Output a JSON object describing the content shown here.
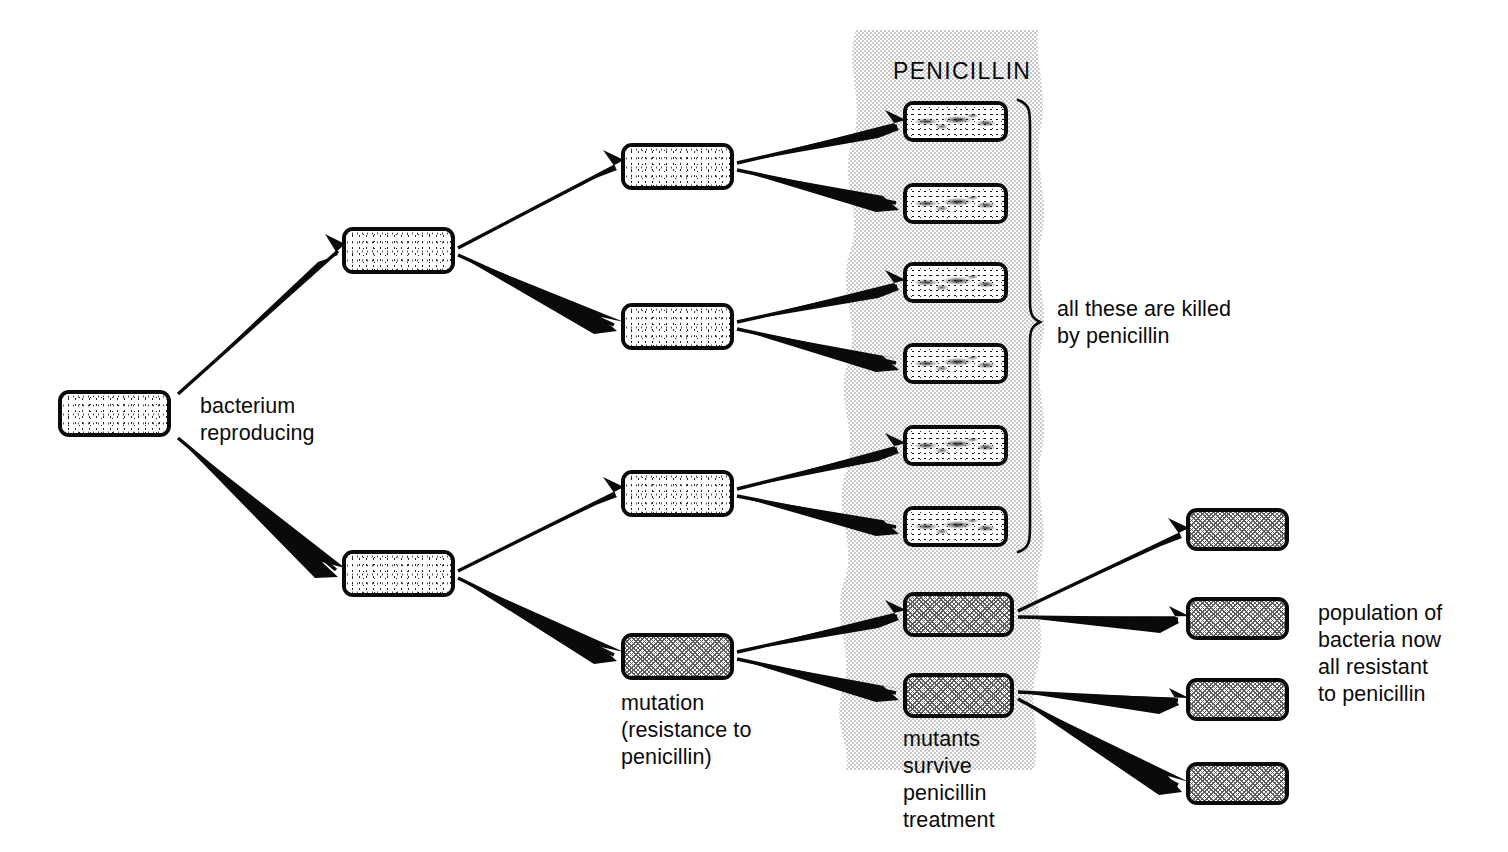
{
  "diagram": {
    "type": "flow-diagram",
    "colors": {
      "ink": "#0a0a0a",
      "paper": "#ffffff",
      "penicillin_band": "#e8e8e8",
      "mutant_fill": "#d9d9d9"
    }
  },
  "labels": {
    "penicillin": "PENICILLIN",
    "bacterium_reproducing": "bacterium\nreproducing",
    "mutation": "mutation\n(resistance to\npenicillin)",
    "mutants_survive": "mutants\nsurvive\npenicillin\ntreatment",
    "all_killed": "all these are killed\nby penicillin",
    "population_resistant": "population of\nbacteria now\nall resistant\nto penicillin"
  },
  "generations": [
    {
      "id": "gen0",
      "name": "founder bacterium",
      "count": 1,
      "cells": [
        {
          "id": "g0c1",
          "kind": "normal",
          "x": 58,
          "y": 390,
          "w": 113,
          "h": 47
        }
      ]
    },
    {
      "id": "gen1",
      "name": "first division",
      "count": 2,
      "cells": [
        {
          "id": "g1c1",
          "kind": "normal",
          "x": 342,
          "y": 227,
          "w": 113,
          "h": 47
        },
        {
          "id": "g1c2",
          "kind": "normal",
          "x": 342,
          "y": 550,
          "w": 113,
          "h": 47
        }
      ]
    },
    {
      "id": "gen2",
      "name": "second division (one mutant arises)",
      "count": 4,
      "cells": [
        {
          "id": "g2c1",
          "kind": "normal",
          "x": 621,
          "y": 143,
          "w": 113,
          "h": 47
        },
        {
          "id": "g2c2",
          "kind": "normal",
          "x": 621,
          "y": 303,
          "w": 113,
          "h": 47
        },
        {
          "id": "g2c3",
          "kind": "normal",
          "x": 621,
          "y": 470,
          "w": 113,
          "h": 47
        },
        {
          "id": "g2c4",
          "kind": "mutant",
          "x": 621,
          "y": 633,
          "w": 113,
          "h": 47
        }
      ]
    },
    {
      "id": "gen3",
      "name": "third division, exposed to penicillin",
      "count": 8,
      "cells": [
        {
          "id": "g3c1",
          "kind": "killed",
          "x": 903,
          "y": 101,
          "w": 105,
          "h": 41
        },
        {
          "id": "g3c2",
          "kind": "killed",
          "x": 903,
          "y": 183,
          "w": 105,
          "h": 41
        },
        {
          "id": "g3c3",
          "kind": "killed",
          "x": 903,
          "y": 262,
          "w": 105,
          "h": 41
        },
        {
          "id": "g3c4",
          "kind": "killed",
          "x": 903,
          "y": 343,
          "w": 105,
          "h": 41
        },
        {
          "id": "g3c5",
          "kind": "killed",
          "x": 903,
          "y": 425,
          "w": 105,
          "h": 41
        },
        {
          "id": "g3c6",
          "kind": "killed",
          "x": 903,
          "y": 506,
          "w": 105,
          "h": 41
        },
        {
          "id": "g3c7",
          "kind": "mutant",
          "x": 903,
          "y": 592,
          "w": 111,
          "h": 45
        },
        {
          "id": "g3c8",
          "kind": "mutant",
          "x": 903,
          "y": 673,
          "w": 111,
          "h": 45
        }
      ]
    },
    {
      "id": "gen4",
      "name": "surviving resistant population",
      "count": 4,
      "cells": [
        {
          "id": "g4c1",
          "kind": "mutant",
          "x": 1186,
          "y": 508,
          "w": 103,
          "h": 43
        },
        {
          "id": "g4c2",
          "kind": "mutant",
          "x": 1186,
          "y": 597,
          "w": 103,
          "h": 43
        },
        {
          "id": "g4c3",
          "kind": "mutant",
          "x": 1186,
          "y": 678,
          "w": 103,
          "h": 43
        },
        {
          "id": "g4c4",
          "kind": "mutant",
          "x": 1186,
          "y": 762,
          "w": 103,
          "h": 43
        }
      ]
    }
  ],
  "arrows": [
    {
      "id": "a1",
      "from": "g0c1",
      "to": "g1c1"
    },
    {
      "id": "a2",
      "from": "g0c1",
      "to": "g1c2"
    },
    {
      "id": "a3",
      "from": "g1c1",
      "to": "g2c1"
    },
    {
      "id": "a4",
      "from": "g1c1",
      "to": "g2c2"
    },
    {
      "id": "a5",
      "from": "g1c2",
      "to": "g2c3"
    },
    {
      "id": "a6",
      "from": "g1c2",
      "to": "g2c4"
    },
    {
      "id": "a7",
      "from": "g2c1",
      "to": "g3c1"
    },
    {
      "id": "a8",
      "from": "g2c1",
      "to": "g3c2"
    },
    {
      "id": "a9",
      "from": "g2c2",
      "to": "g3c3"
    },
    {
      "id": "a10",
      "from": "g2c2",
      "to": "g3c4"
    },
    {
      "id": "a11",
      "from": "g2c3",
      "to": "g3c5"
    },
    {
      "id": "a12",
      "from": "g2c3",
      "to": "g3c6"
    },
    {
      "id": "a13",
      "from": "g2c4",
      "to": "g3c7"
    },
    {
      "id": "a14",
      "from": "g2c4",
      "to": "g3c8"
    },
    {
      "id": "a15",
      "from": "g3c7",
      "to": "g4c1"
    },
    {
      "id": "a16",
      "from": "g3c7",
      "to": "g4c2"
    },
    {
      "id": "a17",
      "from": "g3c8",
      "to": "g4c3"
    },
    {
      "id": "a18",
      "from": "g3c8",
      "to": "g4c4"
    }
  ],
  "brace": {
    "label_ref": "all_killed",
    "spans_cells": [
      "g3c1",
      "g3c2",
      "g3c3",
      "g3c4",
      "g3c5",
      "g3c6"
    ],
    "top": 100,
    "bottom": 552
  },
  "band": {
    "label_ref": "penicillin",
    "left": 836,
    "top": 30,
    "width": 212,
    "height": 740
  }
}
